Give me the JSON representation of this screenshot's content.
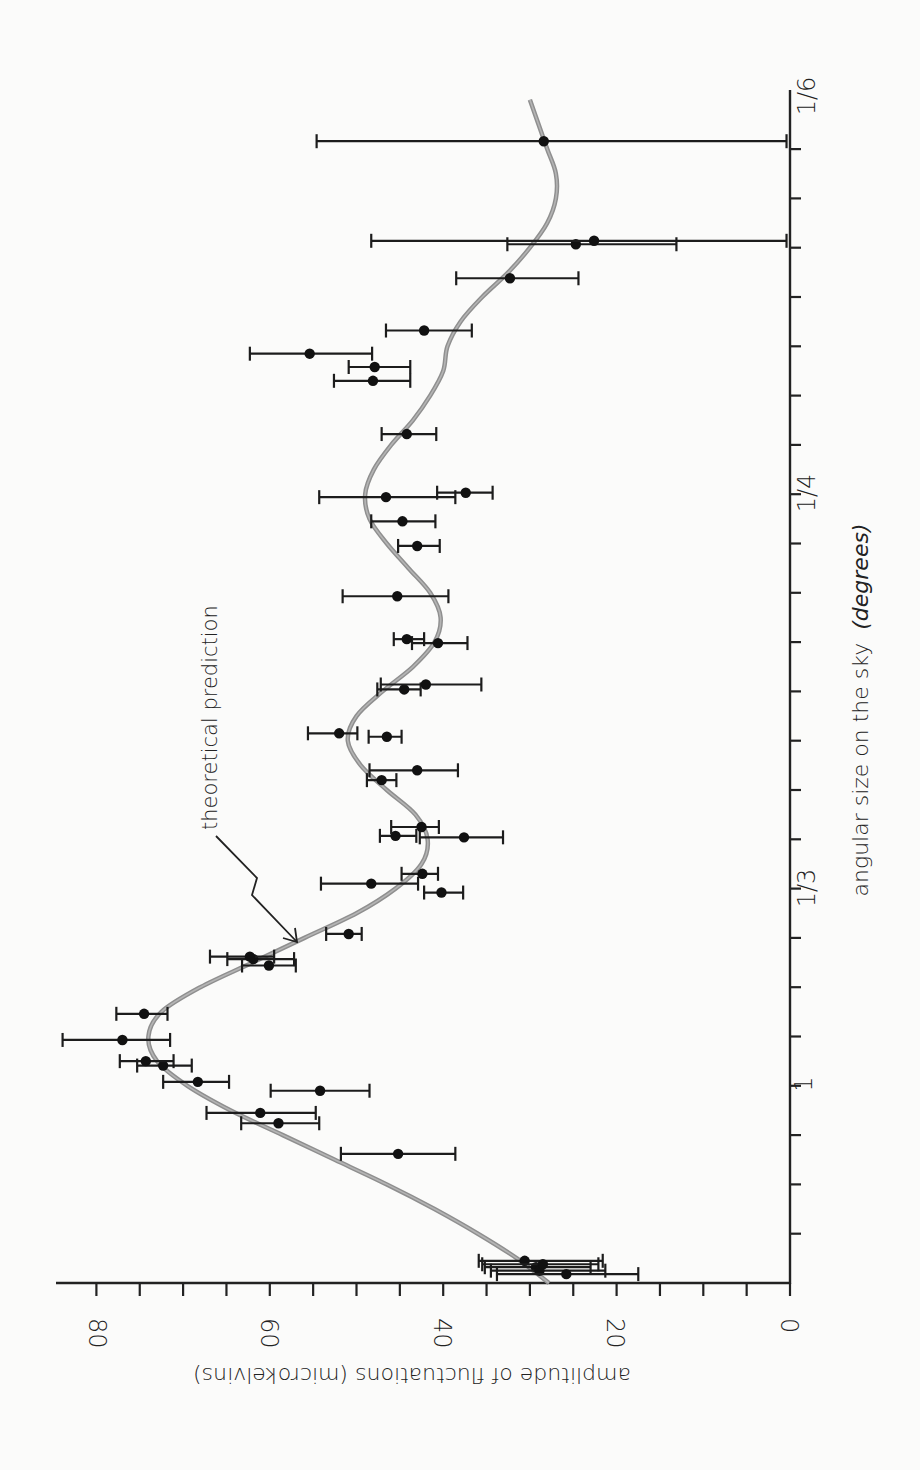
{
  "chart_data": {
    "type": "scatter",
    "orientation": "rotated 90 degrees clockwise (x-axis runs vertically on right, amplitude axis runs horizontally at bottom)",
    "title": "",
    "xlabel": "angular size on the sky",
    "xlabel_units": "(degrees)",
    "ylabel": "amplitude of fluctuations (microkelvins)",
    "ylim": [
      0,
      84
    ],
    "y_ticks": [
      {
        "value": 0,
        "label": "0"
      },
      {
        "value": 20,
        "label": "20"
      },
      {
        "value": 40,
        "label": "40"
      },
      {
        "value": 60,
        "label": "60"
      },
      {
        "value": 80,
        "label": "80"
      }
    ],
    "y_minor_tick_step": 5,
    "x_axis_note": "x position in tick units measured from the origin; one tick per unit",
    "xlim": [
      0,
      24.2
    ],
    "x_ticks_count": 23,
    "x_tick_labels": [
      {
        "position": 4,
        "label": "1"
      },
      {
        "position": 8,
        "label": "1/3"
      },
      {
        "position": 16,
        "label": "1/4"
      },
      {
        "position": 24.2,
        "label": "1/6"
      }
    ],
    "grid": false,
    "legend": null,
    "annotations": [
      {
        "text": "theoretical prediction",
        "points_to": [
          7.0,
          57
        ]
      }
    ],
    "series": [
      {
        "name": "measurements",
        "style": "points with horizontal error bars",
        "points": [
          {
            "x": 0.45,
            "y": 30.6,
            "lo": 21.6,
            "hi": 35.9
          },
          {
            "x": 0.32,
            "y": 29.3,
            "lo": 23.0,
            "hi": 35.2
          },
          {
            "x": 0.25,
            "y": 28.9,
            "lo": 21.3,
            "hi": 34.5
          },
          {
            "x": 0.38,
            "y": 28.5,
            "lo": 22.1,
            "hi": 35.5
          },
          {
            "x": 0.18,
            "y": 25.8,
            "lo": 17.5,
            "hi": 33.8
          },
          {
            "x": 2.62,
            "y": 45.2,
            "lo": 38.6,
            "hi": 51.8
          },
          {
            "x": 3.24,
            "y": 59.0,
            "lo": 54.3,
            "hi": 63.3
          },
          {
            "x": 3.45,
            "y": 61.1,
            "lo": 54.7,
            "hi": 67.3
          },
          {
            "x": 3.9,
            "y": 54.2,
            "lo": 48.5,
            "hi": 59.9
          },
          {
            "x": 4.08,
            "y": 68.3,
            "lo": 64.7,
            "hi": 72.3
          },
          {
            "x": 4.41,
            "y": 72.3,
            "lo": 69.0,
            "hi": 75.3
          },
          {
            "x": 4.5,
            "y": 74.3,
            "lo": 71.1,
            "hi": 77.3
          },
          {
            "x": 4.93,
            "y": 77.0,
            "lo": 71.5,
            "hi": 83.9
          },
          {
            "x": 5.46,
            "y": 74.5,
            "lo": 71.8,
            "hi": 77.7
          },
          {
            "x": 6.44,
            "y": 60.1,
            "lo": 57.0,
            "hi": 63.2
          },
          {
            "x": 6.57,
            "y": 61.9,
            "lo": 57.2,
            "hi": 64.9
          },
          {
            "x": 6.62,
            "y": 62.3,
            "lo": 59.5,
            "hi": 66.9
          },
          {
            "x": 7.08,
            "y": 50.9,
            "lo": 49.4,
            "hi": 53.5
          },
          {
            "x": 7.92,
            "y": 40.2,
            "lo": 37.7,
            "hi": 42.2
          },
          {
            "x": 8.1,
            "y": 48.3,
            "lo": 42.9,
            "hi": 54.1
          },
          {
            "x": 8.3,
            "y": 42.4,
            "lo": 40.6,
            "hi": 44.8
          },
          {
            "x": 9.04,
            "y": 37.6,
            "lo": 33.1,
            "hi": 42.7
          },
          {
            "x": 9.07,
            "y": 45.5,
            "lo": 43.1,
            "hi": 47.3
          },
          {
            "x": 9.25,
            "y": 42.5,
            "lo": 40.5,
            "hi": 46.0
          },
          {
            "x": 10.2,
            "y": 47.1,
            "lo": 45.4,
            "hi": 48.8
          },
          {
            "x": 10.4,
            "y": 43.0,
            "lo": 38.3,
            "hi": 48.5
          },
          {
            "x": 11.08,
            "y": 46.5,
            "lo": 44.8,
            "hi": 48.6
          },
          {
            "x": 11.15,
            "y": 52.0,
            "lo": 49.9,
            "hi": 55.6
          },
          {
            "x": 12.04,
            "y": 44.5,
            "lo": 42.6,
            "hi": 47.6
          },
          {
            "x": 12.14,
            "y": 42.0,
            "lo": 35.6,
            "hi": 47.2
          },
          {
            "x": 12.98,
            "y": 40.6,
            "lo": 37.2,
            "hi": 43.6
          },
          {
            "x": 13.06,
            "y": 44.2,
            "lo": 42.2,
            "hi": 45.7
          },
          {
            "x": 13.93,
            "y": 45.3,
            "lo": 39.4,
            "hi": 51.6
          },
          {
            "x": 14.95,
            "y": 43.0,
            "lo": 40.4,
            "hi": 45.2
          },
          {
            "x": 15.45,
            "y": 44.7,
            "lo": 40.9,
            "hi": 48.3
          },
          {
            "x": 15.94,
            "y": 46.6,
            "lo": 38.6,
            "hi": 54.3
          },
          {
            "x": 16.03,
            "y": 37.4,
            "lo": 34.3,
            "hi": 40.7
          },
          {
            "x": 17.22,
            "y": 44.2,
            "lo": 40.8,
            "hi": 47.1
          },
          {
            "x": 18.3,
            "y": 48.1,
            "lo": 43.8,
            "hi": 52.6
          },
          {
            "x": 18.58,
            "y": 47.9,
            "lo": 43.8,
            "hi": 50.9
          },
          {
            "x": 18.85,
            "y": 55.4,
            "lo": 48.2,
            "hi": 62.3
          },
          {
            "x": 19.32,
            "y": 42.2,
            "lo": 36.7,
            "hi": 46.6
          },
          {
            "x": 20.38,
            "y": 32.3,
            "lo": 24.4,
            "hi": 38.5
          },
          {
            "x": 21.07,
            "y": 24.7,
            "lo": 13.1,
            "hi": 32.6
          },
          {
            "x": 21.14,
            "y": 22.6,
            "lo": 0.4,
            "hi": 48.3
          },
          {
            "x": 23.16,
            "y": 28.4,
            "lo": 0.4,
            "hi": 54.6
          }
        ]
      },
      {
        "name": "theoretical prediction",
        "style": "smooth grey curve",
        "x": [
          0.0,
          0.5,
          1.0,
          1.5,
          2.0,
          2.5,
          3.0,
          3.5,
          4.0,
          4.5,
          5.0,
          5.5,
          6.0,
          6.5,
          7.0,
          7.5,
          8.0,
          8.5,
          9.0,
          9.5,
          10.0,
          10.5,
          11.0,
          11.5,
          12.0,
          12.5,
          13.0,
          13.5,
          14.0,
          14.5,
          15.0,
          15.5,
          16.0,
          16.5,
          17.0,
          17.5,
          18.0,
          18.5,
          19.0,
          19.5,
          20.0,
          20.5,
          21.0,
          21.5,
          22.0,
          22.5,
          23.0,
          23.5,
          24.0
        ],
        "y": [
          27.8,
          31.5,
          36.0,
          41.0,
          46.5,
          52.5,
          58.5,
          64.5,
          69.5,
          73.0,
          74.0,
          72.5,
          68.0,
          62.0,
          56.0,
          50.0,
          45.5,
          42.5,
          41.8,
          43.2,
          46.5,
          49.5,
          51.0,
          50.0,
          47.0,
          43.5,
          41.0,
          40.3,
          41.5,
          44.0,
          46.5,
          48.5,
          49.0,
          48.0,
          46.0,
          43.5,
          41.5,
          40.0,
          39.5,
          38.0,
          35.5,
          32.5,
          30.0,
          28.0,
          27.0,
          27.0,
          28.0,
          29.0,
          30.0
        ]
      }
    ]
  },
  "labels": {
    "x_axis_title": "angular size on the sky",
    "x_axis_units": "(degrees)",
    "y_axis_title": "amplitude of fluctuations (microkelvins)",
    "annotation": "theoretical prediction",
    "y_tick_0": "0",
    "y_tick_20": "20",
    "y_tick_40": "40",
    "y_tick_60": "60",
    "y_tick_80": "80",
    "x_tick_1": "1",
    "x_tick_1_3": "1/3",
    "x_tick_1_4": "1/4",
    "x_tick_1_6": "1/6"
  },
  "colors": {
    "background": "#fbfbfa",
    "ink": "#222222",
    "curve": "#8f8f8f"
  }
}
